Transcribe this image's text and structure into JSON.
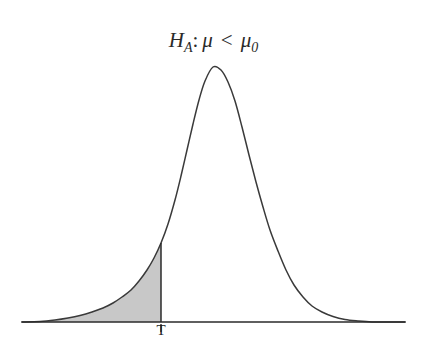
{
  "figure": {
    "title": {
      "hypothesis_symbol": "H",
      "hypothesis_subscript": "A",
      "colon": ":",
      "parameter": "μ",
      "operator": "<",
      "reference_parameter": "μ",
      "reference_subscript": "0",
      "full_text": "H_A: μ < μ_0"
    },
    "axis_label": "T",
    "colors": {
      "background": "#ffffff",
      "curve": "#3a3a3a",
      "axis": "#2b2b2b",
      "shaded_region": "#c8c8c8",
      "text": "#1f1f1f"
    }
  },
  "chart_data": {
    "type": "area",
    "xlabel": "",
    "ylabel": "",
    "grid": false,
    "legend_position": "none",
    "tick_labels": [
      "T"
    ],
    "annotations": [
      {
        "text": "T",
        "x": 161,
        "y": 335,
        "role": "critical-value-label"
      }
    ],
    "axis_baseline_y": 322,
    "axis_x_range": [
      22,
      405
    ],
    "peak": {
      "x": 213,
      "y": 67
    },
    "critical_value": {
      "label": "T",
      "x": 161,
      "curve_y": 243
    },
    "shaded_region": {
      "from_x": 40,
      "to_x": 161,
      "side": "left-tail",
      "color": "#c8c8c8"
    },
    "curve_points": [
      {
        "x": 22,
        "y": 322
      },
      {
        "x": 40,
        "y": 321.5
      },
      {
        "x": 55,
        "y": 320
      },
      {
        "x": 68,
        "y": 318
      },
      {
        "x": 80,
        "y": 315.5
      },
      {
        "x": 92,
        "y": 312
      },
      {
        "x": 103,
        "y": 308
      },
      {
        "x": 113,
        "y": 303
      },
      {
        "x": 122,
        "y": 297
      },
      {
        "x": 131,
        "y": 290
      },
      {
        "x": 139,
        "y": 281
      },
      {
        "x": 147,
        "y": 270
      },
      {
        "x": 154,
        "y": 258
      },
      {
        "x": 161,
        "y": 243
      },
      {
        "x": 168,
        "y": 224
      },
      {
        "x": 175,
        "y": 200
      },
      {
        "x": 181,
        "y": 176
      },
      {
        "x": 187,
        "y": 150
      },
      {
        "x": 193,
        "y": 124
      },
      {
        "x": 199,
        "y": 100
      },
      {
        "x": 205,
        "y": 81
      },
      {
        "x": 213,
        "y": 67
      },
      {
        "x": 221,
        "y": 70
      },
      {
        "x": 228,
        "y": 82
      },
      {
        "x": 235,
        "y": 101
      },
      {
        "x": 242,
        "y": 127
      },
      {
        "x": 249,
        "y": 155
      },
      {
        "x": 256,
        "y": 182
      },
      {
        "x": 263,
        "y": 207
      },
      {
        "x": 270,
        "y": 230
      },
      {
        "x": 278,
        "y": 251
      },
      {
        "x": 286,
        "y": 270
      },
      {
        "x": 294,
        "y": 285
      },
      {
        "x": 303,
        "y": 297
      },
      {
        "x": 312,
        "y": 306
      },
      {
        "x": 322,
        "y": 312
      },
      {
        "x": 333,
        "y": 316.5
      },
      {
        "x": 345,
        "y": 319.5
      },
      {
        "x": 358,
        "y": 321
      },
      {
        "x": 372,
        "y": 322
      },
      {
        "x": 390,
        "y": 322
      },
      {
        "x": 405,
        "y": 322
      }
    ]
  }
}
